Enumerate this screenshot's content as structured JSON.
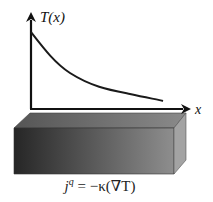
{
  "diagram": {
    "y_axis_label": "T(x)",
    "x_axis_label": "x",
    "curve": "exponential decay of temperature T(x) along x",
    "equation": "j^q = −κ(∇T)",
    "equation_parts": {
      "j": "j",
      "sup": "q",
      "rest": " = −κ(∇T)"
    },
    "colors": {
      "axis": "#111111",
      "curve": "#1a1a1a",
      "bar_front_dark": "#2a2a2a",
      "bar_front_light": "#8a8a8a",
      "bar_top": "#7d7d7d",
      "bar_side": "#a3a3a3"
    }
  }
}
